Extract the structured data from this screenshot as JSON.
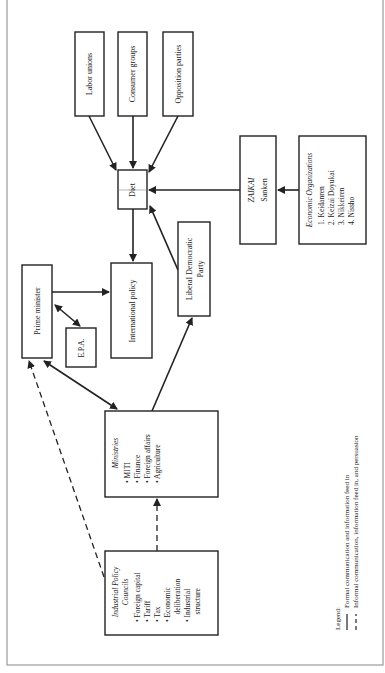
{
  "diagram": {
    "nodes": {
      "labor_unions": "Labor unions",
      "consumer_groups": "Consumer groups",
      "opposition_parties": "Opposition parties",
      "diet": "Diet",
      "zaikai": {
        "title": "ZAIKAI",
        "subtitle": "Sanken"
      },
      "economic_orgs": {
        "title": "Economic Organizations",
        "items": [
          "1.  Keidanren",
          "2.  Keizai Doyukai",
          "3.  Nikkeiren",
          "4.  Nissho"
        ]
      },
      "prime_minister": "Prime minister",
      "epa": "E.P.A.",
      "international_policy": "International policy",
      "ldp": {
        "line1": "Liberal Democratic",
        "line2": "Party"
      },
      "ministries": {
        "title": "Ministries",
        "items": [
          "•  MITI",
          "•  Finance",
          "•  Foreign affairs",
          "•  Agriculture"
        ]
      },
      "councils": {
        "title_line1": "Industrial Policy",
        "title_line2": "Councils",
        "items": [
          "•  Foreign capital",
          "•  Tariff",
          "•  Tax",
          "•  Economic",
          "    deliberation",
          "•  Industrial",
          "    structure"
        ]
      }
    },
    "edges": [
      {
        "from": "Labor unions",
        "to": "Diet",
        "type": "formal"
      },
      {
        "from": "Consumer groups",
        "to": "Diet",
        "type": "formal"
      },
      {
        "from": "Opposition parties",
        "to": "Diet",
        "type": "formal"
      },
      {
        "from": "ZAIKAI",
        "to": "Diet",
        "type": "formal"
      },
      {
        "from": "Economic Organizations",
        "to": "ZAIKAI",
        "type": "formal"
      },
      {
        "from": "Liberal Democratic Party",
        "to": "Diet",
        "type": "formal"
      },
      {
        "from": "Diet",
        "to": "International policy",
        "type": "formal"
      },
      {
        "from": "Prime minister",
        "to": "International policy",
        "type": "formal"
      },
      {
        "from": "Prime minister",
        "to": "E.P.A.",
        "type": "formal",
        "bidirectional": true
      },
      {
        "from": "Prime minister",
        "to": "Ministries",
        "type": "formal",
        "bidirectional": true
      },
      {
        "from": "Ministries",
        "to": "Liberal Democratic Party",
        "type": "formal"
      },
      {
        "from": "Industrial Policy Councils",
        "to": "Ministries",
        "type": "informal"
      },
      {
        "from": "Industrial Policy Councils",
        "to": "Prime minister",
        "type": "informal"
      }
    ],
    "legend": {
      "title": "Legend:",
      "formal": "Formal communication and information feed in",
      "informal": "Informal communication, information feed in, and persuasion"
    }
  }
}
